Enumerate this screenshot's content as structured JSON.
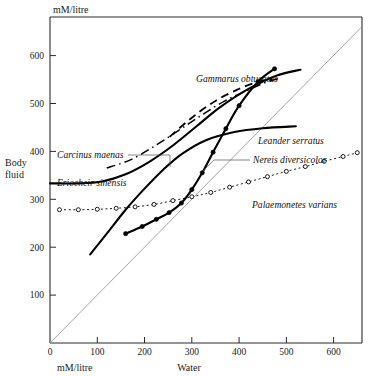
{
  "chart_data": {
    "type": "line",
    "title": "",
    "xlabel": "Water",
    "ylabel": "Body fluid",
    "x_unit": "mM/litre",
    "y_unit": "mM/litre",
    "xlim": [
      0,
      660
    ],
    "ylim": [
      0,
      680
    ],
    "xticks": [
      0,
      100,
      200,
      300,
      400,
      500,
      600
    ],
    "yticks": [
      100,
      200,
      300,
      400,
      500,
      600
    ],
    "grid": false,
    "legend": "inline-annotations",
    "reference_line": {
      "name": "isosmotic-line",
      "description": "diagonal line of equality body fluid = water",
      "from": [
        0,
        0
      ],
      "to": [
        660,
        660
      ]
    },
    "series": [
      {
        "name": "Gammarus obtusatus",
        "style": "dashed",
        "marker": "none",
        "points": [
          [
            253,
            430
          ],
          [
            300,
            470
          ],
          [
            350,
            505
          ],
          [
            400,
            530
          ],
          [
            440,
            545
          ],
          [
            470,
            551
          ]
        ]
      },
      {
        "name": "Carcinus maenas",
        "style": "dash-dot",
        "marker": "none",
        "points": [
          [
            120,
            365
          ],
          [
            170,
            382
          ],
          [
            220,
            410
          ],
          [
            270,
            442
          ],
          [
            320,
            475
          ],
          [
            370,
            505
          ],
          [
            420,
            528
          ],
          [
            460,
            545
          ],
          [
            490,
            553
          ]
        ]
      },
      {
        "name": "Eriocheir sinensis",
        "style": "solid",
        "marker": "none",
        "points": [
          [
            0,
            333
          ],
          [
            60,
            333
          ],
          [
            110,
            337
          ],
          [
            160,
            352
          ],
          [
            210,
            378
          ],
          [
            260,
            412
          ],
          [
            310,
            452
          ],
          [
            360,
            492
          ],
          [
            420,
            530
          ],
          [
            480,
            558
          ],
          [
            530,
            570
          ]
        ]
      },
      {
        "name": "Leander serratus",
        "style": "solid",
        "marker": "none",
        "points": [
          [
            85,
            185
          ],
          [
            120,
            228
          ],
          [
            160,
            278
          ],
          [
            200,
            322
          ],
          [
            240,
            362
          ],
          [
            280,
            395
          ],
          [
            330,
            423
          ],
          [
            390,
            440
          ],
          [
            450,
            448
          ],
          [
            520,
            452
          ]
        ]
      },
      {
        "name": "Nereis diversicolor",
        "style": "solid",
        "marker": "filled-circle",
        "points": [
          [
            160,
            228
          ],
          [
            195,
            243
          ],
          [
            225,
            258
          ],
          [
            252,
            272
          ],
          [
            278,
            292
          ],
          [
            300,
            320
          ],
          [
            322,
            355
          ],
          [
            345,
            398
          ],
          [
            372,
            447
          ],
          [
            400,
            495
          ],
          [
            440,
            545
          ],
          [
            475,
            572
          ]
        ]
      },
      {
        "name": "Palaemonetes varians",
        "style": "dotted",
        "marker": "open-circle",
        "points": [
          [
            20,
            278
          ],
          [
            60,
            278
          ],
          [
            100,
            279
          ],
          [
            140,
            281
          ],
          [
            180,
            284
          ],
          [
            220,
            289
          ],
          [
            260,
            297
          ],
          [
            300,
            305
          ],
          [
            340,
            314
          ],
          [
            380,
            325
          ],
          [
            420,
            336
          ],
          [
            460,
            347
          ],
          [
            500,
            358
          ],
          [
            540,
            368
          ],
          [
            580,
            379
          ],
          [
            620,
            389
          ],
          [
            650,
            397
          ]
        ]
      }
    ],
    "annotations": [
      {
        "name": "Gammarus obtusatus",
        "x": 196,
        "y": 82,
        "anchor": "start",
        "leader": null
      },
      {
        "name": "Carcinus maenas",
        "x": 57,
        "y": 158,
        "anchor": "start",
        "leader": [
          [
            128,
            155
          ],
          [
            170,
            155
          ],
          [
            170,
            167
          ]
        ]
      },
      {
        "name": "Eriocheir sinensis",
        "x": 57,
        "y": 186,
        "anchor": "start",
        "leader": null
      },
      {
        "name": "Leander serratus",
        "x": 258,
        "y": 144,
        "anchor": "start",
        "leader": null
      },
      {
        "name": "Nereis diversicolor",
        "x": 253,
        "y": 163,
        "anchor": "start",
        "leader": [
          [
            250,
            160
          ],
          [
            214,
            160
          ],
          [
            203,
            171
          ]
        ]
      },
      {
        "name": "Palaemonetes varians",
        "x": 252,
        "y": 208,
        "anchor": "start",
        "leader": null
      }
    ]
  },
  "labels": {
    "y_unit_top": "mM/litre",
    "x_unit_bottom": "mM/litre",
    "y_axis_title_line1": "Body",
    "y_axis_title_line2": "fluid",
    "x_axis_title": "Water",
    "yticks": [
      "600",
      "500",
      "400",
      "300",
      "200",
      "100"
    ],
    "xticks": [
      "0",
      "100",
      "200",
      "300",
      "400",
      "500",
      "600"
    ],
    "species": [
      "Gammarus obtusatus",
      "Carcinus maenas",
      "Eriocheir sinensis",
      "Leander serratus",
      "Nereis diversicolor",
      "Palaemonetes varians"
    ]
  },
  "colors": {
    "background": "#ffffff",
    "ink": "#000000",
    "axis": "#2b2b2b",
    "isosmotic": "#8d8d8d"
  }
}
